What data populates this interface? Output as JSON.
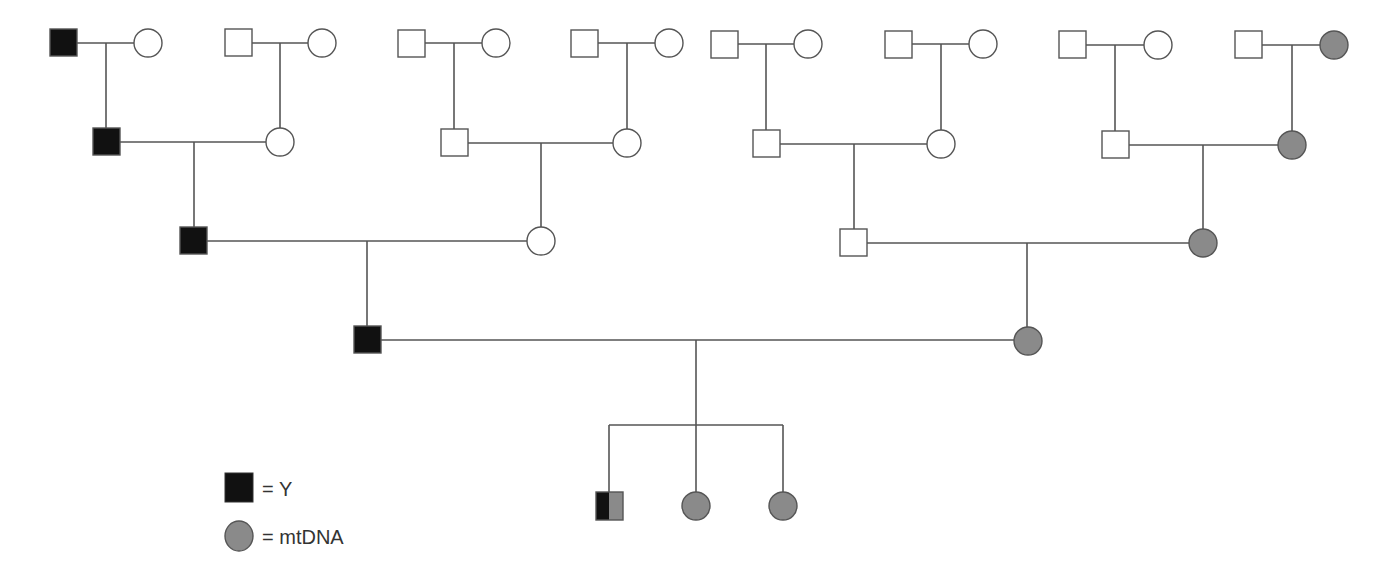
{
  "diagram": {
    "type": "pedigree",
    "width": 1386,
    "height": 578,
    "colors": {
      "y_fill": "#111111",
      "mt_fill": "#8a8a8a",
      "empty_fill": "#ffffff",
      "stroke": "#555555"
    },
    "size": 27,
    "radius": 14,
    "individuals": [
      {
        "id": "g1m1",
        "sex": "male",
        "x": 50,
        "y": 29,
        "marker": "y"
      },
      {
        "id": "g1f1",
        "sex": "female",
        "x": 148,
        "y": 43,
        "marker": "none"
      },
      {
        "id": "g1m2",
        "sex": "male",
        "x": 225,
        "y": 29,
        "marker": "none"
      },
      {
        "id": "g1f2",
        "sex": "female",
        "x": 322,
        "y": 43,
        "marker": "none"
      },
      {
        "id": "g1m3",
        "sex": "male",
        "x": 398,
        "y": 30,
        "marker": "none"
      },
      {
        "id": "g1f3",
        "sex": "female",
        "x": 496,
        "y": 43,
        "marker": "none"
      },
      {
        "id": "g1m4",
        "sex": "male",
        "x": 571,
        "y": 30,
        "marker": "none"
      },
      {
        "id": "g1f4",
        "sex": "female",
        "x": 669,
        "y": 43,
        "marker": "none"
      },
      {
        "id": "g1m5",
        "sex": "male",
        "x": 711,
        "y": 31,
        "marker": "none"
      },
      {
        "id": "g1f5",
        "sex": "female",
        "x": 808,
        "y": 44,
        "marker": "none"
      },
      {
        "id": "g1m6",
        "sex": "male",
        "x": 885,
        "y": 31,
        "marker": "none"
      },
      {
        "id": "g1f6",
        "sex": "female",
        "x": 983,
        "y": 44,
        "marker": "none"
      },
      {
        "id": "g1m7",
        "sex": "male",
        "x": 1059,
        "y": 31,
        "marker": "none"
      },
      {
        "id": "g1f7",
        "sex": "female",
        "x": 1158,
        "y": 45,
        "marker": "none"
      },
      {
        "id": "g1m8",
        "sex": "male",
        "x": 1235,
        "y": 31,
        "marker": "none"
      },
      {
        "id": "g1f8",
        "sex": "female",
        "x": 1334,
        "y": 45,
        "marker": "mt"
      },
      {
        "id": "g2m1",
        "sex": "male",
        "x": 93,
        "y": 128,
        "marker": "y"
      },
      {
        "id": "g2f1",
        "sex": "female",
        "x": 280,
        "y": 142,
        "marker": "none"
      },
      {
        "id": "g2m2",
        "sex": "male",
        "x": 441,
        "y": 129,
        "marker": "none"
      },
      {
        "id": "g2f2",
        "sex": "female",
        "x": 627,
        "y": 143,
        "marker": "none"
      },
      {
        "id": "g2m3",
        "sex": "male",
        "x": 753,
        "y": 130,
        "marker": "none"
      },
      {
        "id": "g2f3",
        "sex": "female",
        "x": 941,
        "y": 144,
        "marker": "none"
      },
      {
        "id": "g2m4",
        "sex": "male",
        "x": 1102,
        "y": 131,
        "marker": "none"
      },
      {
        "id": "g2f4",
        "sex": "female",
        "x": 1292,
        "y": 145,
        "marker": "mt"
      },
      {
        "id": "g3m1",
        "sex": "male",
        "x": 180,
        "y": 227,
        "marker": "y"
      },
      {
        "id": "g3f1",
        "sex": "female",
        "x": 541,
        "y": 241,
        "marker": "none"
      },
      {
        "id": "g3m2",
        "sex": "male",
        "x": 840,
        "y": 229,
        "marker": "none"
      },
      {
        "id": "g3f2",
        "sex": "female",
        "x": 1203,
        "y": 243,
        "marker": "mt"
      },
      {
        "id": "g4m1",
        "sex": "male",
        "x": 354,
        "y": 326,
        "marker": "y"
      },
      {
        "id": "g4f1",
        "sex": "female",
        "x": 1028,
        "y": 341,
        "marker": "mt"
      },
      {
        "id": "g5m1",
        "sex": "male",
        "x": 596,
        "y": 492,
        "marker": "both"
      },
      {
        "id": "g5f1",
        "sex": "female",
        "x": 696,
        "y": 506,
        "marker": "mt"
      },
      {
        "id": "g5f2",
        "sex": "female",
        "x": 783,
        "y": 506,
        "marker": "mt"
      }
    ],
    "lines": [
      [
        77,
        43,
        134,
        43
      ],
      [
        106,
        43,
        106,
        128
      ],
      [
        252,
        43,
        308,
        43
      ],
      [
        280,
        43,
        280,
        128
      ],
      [
        425,
        43,
        482,
        43
      ],
      [
        454,
        43,
        454,
        129
      ],
      [
        598,
        43,
        655,
        43
      ],
      [
        627,
        43,
        627,
        129
      ],
      [
        737,
        44,
        794,
        44
      ],
      [
        766,
        44,
        766,
        130
      ],
      [
        912,
        44,
        969,
        44
      ],
      [
        941,
        44,
        941,
        130
      ],
      [
        1086,
        45,
        1144,
        45
      ],
      [
        1115,
        45,
        1115,
        131
      ],
      [
        1262,
        45,
        1320,
        45
      ],
      [
        1292,
        45,
        1292,
        131
      ],
      [
        120,
        142,
        266,
        142
      ],
      [
        194,
        142,
        194,
        227
      ],
      [
        468,
        143,
        613,
        143
      ],
      [
        541,
        143,
        541,
        227
      ],
      [
        780,
        144,
        927,
        144
      ],
      [
        854,
        144,
        854,
        229
      ],
      [
        1129,
        145,
        1278,
        145
      ],
      [
        1203,
        145,
        1203,
        229
      ],
      [
        207,
        241,
        527,
        241
      ],
      [
        367,
        241,
        367,
        326
      ],
      [
        867,
        243,
        1189,
        243
      ],
      [
        1027,
        243,
        1027,
        327
      ],
      [
        381,
        340,
        1014,
        340
      ],
      [
        696,
        340,
        696,
        425
      ],
      [
        609,
        425,
        783,
        425
      ],
      [
        609,
        425,
        609,
        492
      ],
      [
        696,
        425,
        696,
        492
      ],
      [
        783,
        425,
        783,
        492
      ]
    ]
  },
  "legend": {
    "items": [
      {
        "symbol": "black-square",
        "label": "= Y"
      },
      {
        "symbol": "gray-circle",
        "label": "= mtDNA"
      }
    ]
  }
}
